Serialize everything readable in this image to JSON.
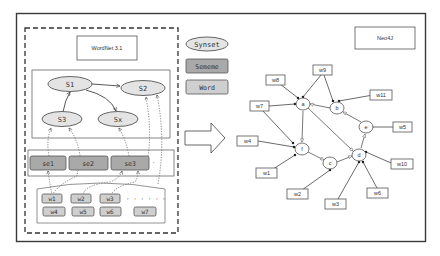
{
  "left_panel": {
    "title": "WordNet 3.1",
    "synsets": [
      {
        "id": "S1",
        "label": "S1",
        "x": 70,
        "y": 84
      },
      {
        "id": "S2",
        "label": "S2",
        "x": 143,
        "y": 88
      },
      {
        "id": "S3",
        "label": "S3",
        "x": 62,
        "y": 119
      },
      {
        "id": "Sx",
        "label": "Sx",
        "x": 118,
        "y": 119
      }
    ],
    "synset_edges": [
      {
        "from": "S3",
        "to": "S1"
      },
      {
        "from": "S1",
        "to": "S2"
      },
      {
        "from": "S1",
        "to": "Sx"
      }
    ],
    "sememes": [
      {
        "id": "se1",
        "label": "se1"
      },
      {
        "id": "se2",
        "label": "se2"
      },
      {
        "id": "se3",
        "label": "se3"
      }
    ],
    "words_row1": [
      {
        "label": "w1"
      },
      {
        "label": "w2"
      },
      {
        "label": "w3"
      }
    ],
    "words_row2": [
      {
        "label": "w4"
      },
      {
        "label": "w5"
      },
      {
        "label": "w6"
      },
      {
        "label": "w7"
      }
    ],
    "ellipsis": "· · ·   · · ·"
  },
  "legend": {
    "synset": "Synset",
    "sememe": "Sememe",
    "word": "Word"
  },
  "right_panel": {
    "title": "Neo4J",
    "nodes": [
      {
        "id": "a",
        "label": "a",
        "x": 303,
        "y": 104
      },
      {
        "id": "b",
        "label": "b",
        "x": 337,
        "y": 108
      },
      {
        "id": "e",
        "label": "e",
        "x": 366,
        "y": 127
      },
      {
        "id": "f",
        "label": "f",
        "x": 302,
        "y": 149
      },
      {
        "id": "c",
        "label": "c",
        "x": 330,
        "y": 163
      },
      {
        "id": "d",
        "label": "d",
        "x": 359,
        "y": 155
      }
    ],
    "words": [
      {
        "id": "w8",
        "label": "w8",
        "x": 276,
        "y": 80,
        "to": "a"
      },
      {
        "id": "w9",
        "label": "w9",
        "x": 323,
        "y": 70,
        "to": "a"
      },
      {
        "id": "w11",
        "label": "w11",
        "x": 381,
        "y": 95,
        "to": "b"
      },
      {
        "id": "w7",
        "label": "w7",
        "x": 259,
        "y": 106,
        "to": "a"
      },
      {
        "id": "w5",
        "label": "w5",
        "x": 402,
        "y": 127,
        "to": "e"
      },
      {
        "id": "w4",
        "label": "w4",
        "x": 248,
        "y": 141,
        "to": "f"
      },
      {
        "id": "w10",
        "label": "w10",
        "x": 402,
        "y": 164,
        "to": "d"
      },
      {
        "id": "w1",
        "label": "w1",
        "x": 262,
        "y": 173,
        "to": "f"
      },
      {
        "id": "w2",
        "label": "w2",
        "x": 296,
        "y": 194,
        "to": "c"
      },
      {
        "id": "w6",
        "label": "w6",
        "x": 379,
        "y": 193,
        "to": "d"
      },
      {
        "id": "w3",
        "label": "w3",
        "x": 336,
        "y": 204,
        "to": "d"
      }
    ],
    "relations": [
      {
        "from": "b",
        "to": "a"
      },
      {
        "from": "e",
        "to": "b"
      },
      {
        "from": "a",
        "to": "f"
      },
      {
        "from": "f",
        "to": "c"
      },
      {
        "from": "c",
        "to": "d"
      },
      {
        "from": "a",
        "to": "d"
      },
      {
        "from": "d",
        "to": "e"
      }
    ]
  },
  "colors": {
    "border": "#3a3a3a",
    "synset_fill": "#e4e4e4",
    "sememe_fill": "#a9a9a9",
    "word_fill": "#cfcfcf",
    "line": "#555555"
  }
}
